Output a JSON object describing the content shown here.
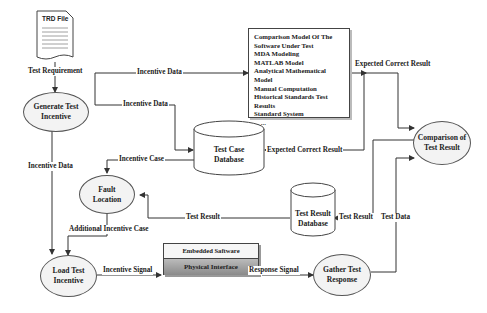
{
  "diagram": {
    "nodes": {
      "trd_file": "TRD File",
      "generate_test_incentive": [
        "Generate Test",
        "Incentive"
      ],
      "comparison_model_box": [
        "Comparison Model Of The",
        "Software Under Test",
        "MDA Modeling",
        "MATLAB Model",
        "Analytical Mathematical Model",
        "Manual Computation",
        "Historical Standards Test",
        "Results",
        "Standard System",
        "... ..."
      ],
      "test_case_database": [
        "Test Case",
        "Database"
      ],
      "comparison_of_test_result": [
        "Comparison  of",
        "Test Result"
      ],
      "fault_location": [
        "Fault",
        "Location"
      ],
      "test_result_database": [
        "Test Result",
        "Database"
      ],
      "load_test_incentive": [
        "Load Test",
        "Incentive"
      ],
      "embedded_software": "Embedded Saftware",
      "physical_interface": "Physical Interface",
      "gather_test_response": [
        "Gather Test",
        "Response"
      ]
    },
    "edges": {
      "test_requirement": "Test Requirement",
      "incentive_data_top": "Incentive Data",
      "incentive_data_mid": "Incentive Data",
      "incentive_data_left": "Incentive Data",
      "expected_correct_result_top": "Expected  Correct Result",
      "expected_correct_result_mid": "Expected Correct Result",
      "incentive_case": "Incentive Case",
      "test_result_left": "Test Result",
      "test_result_right": "Test Result",
      "test_data": "Test Data",
      "additional_incentive_case": "Additional Incentive Case",
      "incentive_signal": "Incentive Signal",
      "response_signal": "Response Signal"
    }
  }
}
